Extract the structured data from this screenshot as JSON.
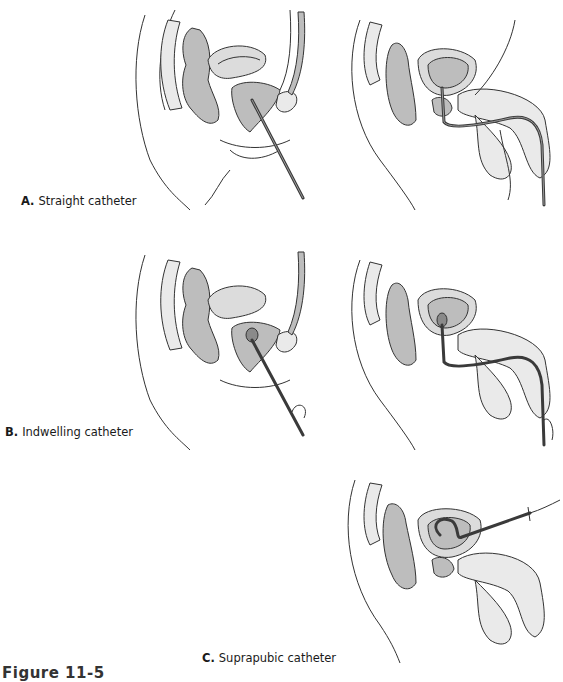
{
  "figure": {
    "caption": "Figure 11-5",
    "panels": [
      {
        "id": "A",
        "letter": "A.",
        "title": "Straight catheter",
        "views": [
          "female",
          "male"
        ]
      },
      {
        "id": "B",
        "letter": "B.",
        "title": "Indwelling catheter",
        "views": [
          "female",
          "male"
        ]
      },
      {
        "id": "C",
        "letter": "C.",
        "title": "Suprapubic catheter",
        "views": [
          "male"
        ]
      }
    ]
  },
  "colors": {
    "line": "#333333",
    "organ_dark": "#bdbdbd",
    "organ_mid": "#dcdcdc",
    "organ_light": "#eaeaea",
    "catheter": "#3a3a3a"
  }
}
